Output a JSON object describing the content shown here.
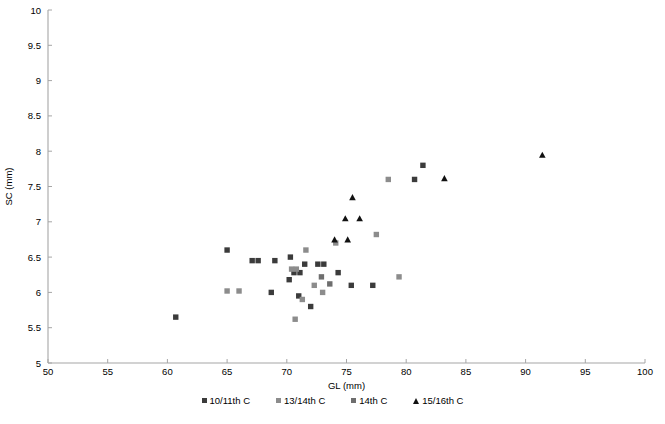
{
  "chart_data": {
    "type": "scatter",
    "title": "",
    "xlabel": "GL (mm)",
    "ylabel": "SC (mm)",
    "xlim": [
      50,
      100
    ],
    "ylim": [
      5,
      10
    ],
    "xticks": [
      50,
      55,
      60,
      65,
      70,
      75,
      80,
      85,
      90,
      95,
      100
    ],
    "yticks": [
      5,
      5.5,
      6,
      6.5,
      7,
      7.5,
      8,
      8.5,
      9,
      9.5,
      10
    ],
    "xtick_labels": [
      "50",
      "55",
      "60",
      "65",
      "70",
      "75",
      "80",
      "85",
      "90",
      "95",
      "100"
    ],
    "ytick_labels": [
      "5",
      "5.5",
      "6",
      "6.5",
      "7",
      "7.5",
      "8",
      "8.5",
      "9",
      "9.5",
      "10"
    ],
    "grid": false,
    "legend_position": "bottom",
    "axis_color": "#a6a6a6",
    "series": [
      {
        "name": "10/11th C",
        "marker": "square",
        "color": "#3b3b3b",
        "points": [
          [
            60.7,
            5.65
          ],
          [
            65.0,
            6.6
          ],
          [
            67.1,
            6.45
          ],
          [
            67.6,
            6.45
          ],
          [
            69.0,
            6.45
          ],
          [
            68.7,
            6.0
          ],
          [
            70.3,
            6.5
          ],
          [
            70.6,
            6.28
          ],
          [
            71.1,
            6.28
          ],
          [
            71.5,
            6.4
          ],
          [
            72.6,
            6.4
          ],
          [
            73.1,
            6.4
          ],
          [
            70.2,
            6.18
          ],
          [
            71.0,
            5.95
          ],
          [
            72.0,
            5.8
          ],
          [
            74.3,
            6.28
          ],
          [
            75.4,
            6.1
          ],
          [
            77.2,
            6.1
          ],
          [
            80.7,
            7.6
          ],
          [
            81.4,
            7.8
          ]
        ]
      },
      {
        "name": "13/14th C",
        "marker": "square",
        "color": "#8c8c8c",
        "points": [
          [
            65.0,
            6.02
          ],
          [
            66.0,
            6.02
          ],
          [
            70.4,
            6.33
          ],
          [
            70.8,
            6.33
          ],
          [
            71.6,
            6.6
          ],
          [
            72.3,
            6.1
          ],
          [
            71.3,
            5.9
          ],
          [
            70.7,
            5.62
          ],
          [
            73.0,
            6.0
          ],
          [
            74.1,
            6.7
          ],
          [
            77.5,
            6.82
          ],
          [
            78.5,
            7.6
          ],
          [
            79.4,
            6.22
          ]
        ]
      },
      {
        "name": "14th C",
        "marker": "square",
        "color": "#6e6e6e",
        "points": [
          [
            72.9,
            6.22
          ],
          [
            73.6,
            6.12
          ]
        ]
      },
      {
        "name": "15/16th C",
        "marker": "triangle",
        "color": "#111111",
        "points": [
          [
            74.0,
            6.75
          ],
          [
            75.1,
            6.75
          ],
          [
            74.9,
            7.05
          ],
          [
            76.1,
            7.05
          ],
          [
            75.5,
            7.35
          ],
          [
            83.2,
            7.62
          ],
          [
            91.4,
            7.95
          ]
        ]
      }
    ]
  },
  "legend": {
    "items": [
      {
        "label": "10/11th C",
        "marker": "square",
        "color": "#3b3b3b"
      },
      {
        "label": "13/14th C",
        "marker": "square",
        "color": "#8c8c8c"
      },
      {
        "label": "14th C",
        "marker": "square",
        "color": "#6e6e6e"
      },
      {
        "label": "15/16th C",
        "marker": "triangle",
        "color": "#111111"
      }
    ]
  }
}
